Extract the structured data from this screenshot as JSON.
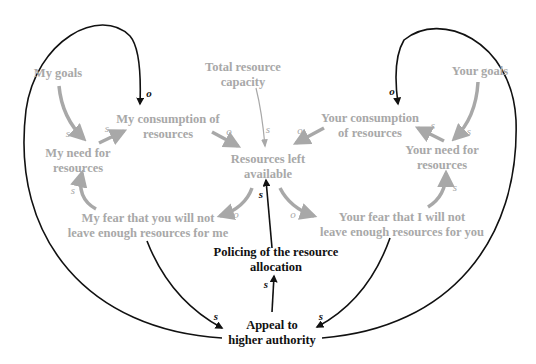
{
  "diagram": {
    "type": "causal-loop",
    "colors": {
      "gray_node": "#a8a8a8",
      "gray_arrow": "#a8a8a8",
      "dark_node": "#111111",
      "dark_arrow": "#111111",
      "background": "#ffffff"
    },
    "nodes": {
      "my_goals": {
        "lines": [
          "My goals"
        ]
      },
      "my_need": {
        "lines": [
          "My need for",
          "resources"
        ]
      },
      "my_consumption": {
        "lines": [
          "My consumption of",
          "resources"
        ]
      },
      "total_capacity": {
        "lines": [
          "Total resource",
          "capacity"
        ]
      },
      "resources_left": {
        "lines": [
          "Resources left",
          "available"
        ]
      },
      "your_consumption": {
        "lines": [
          "Your consumption",
          "of resources"
        ]
      },
      "your_goals": {
        "lines": [
          "Your goals"
        ]
      },
      "your_need": {
        "lines": [
          "Your need for",
          "resources"
        ]
      },
      "my_fear": {
        "lines": [
          "My fear that you will not",
          "leave enough resources for me"
        ]
      },
      "your_fear": {
        "lines": [
          "Your fear that I will not",
          "leave enough resources for you"
        ]
      },
      "policing": {
        "lines": [
          "Policing of the resource",
          "allocation"
        ]
      },
      "appeal": {
        "lines": [
          "Appeal to",
          "higher authority"
        ]
      }
    },
    "links": [
      {
        "from": "My goals",
        "to": "My need for resources",
        "polarity": "s"
      },
      {
        "from": "My need for resources",
        "to": "My consumption of resources",
        "polarity": "s"
      },
      {
        "from": "My consumption of resources",
        "to": "Resources left available",
        "polarity": "o"
      },
      {
        "from": "Total resource capacity",
        "to": "Resources left available",
        "polarity": "s"
      },
      {
        "from": "Your consumption of resources",
        "to": "Resources left available",
        "polarity": "o"
      },
      {
        "from": "Your goals",
        "to": "Your need for resources",
        "polarity": "s"
      },
      {
        "from": "Your need for resources",
        "to": "Your consumption of resources",
        "polarity": "s"
      },
      {
        "from": "Resources left available",
        "to": "My fear that you will not leave enough resources for me",
        "polarity": "o"
      },
      {
        "from": "Resources left available",
        "to": "Your fear that I will not leave enough resources for you",
        "polarity": "o"
      },
      {
        "from": "My fear that you will not leave enough resources for me",
        "to": "My need for resources",
        "polarity": "s"
      },
      {
        "from": "Your fear that I will not leave enough resources for you",
        "to": "Your need for resources",
        "polarity": "s"
      },
      {
        "from": "My fear that you will not leave enough resources for me",
        "to": "Appeal to higher authority",
        "polarity": "s"
      },
      {
        "from": "Your fear that I will not leave enough resources for you",
        "to": "Appeal to higher authority",
        "polarity": "s"
      },
      {
        "from": "Appeal to higher authority",
        "to": "Policing of the resource allocation",
        "polarity": "s"
      },
      {
        "from": "Policing of the resource allocation",
        "to": "Resources left available",
        "polarity": "s"
      },
      {
        "from": "Appeal to higher authority",
        "to": "My consumption of resources",
        "polarity": "o"
      },
      {
        "from": "Appeal to higher authority",
        "to": "Your consumption of resources",
        "polarity": "o"
      }
    ],
    "polarity_labels": {
      "goals_need_left": "s",
      "need_cons_left": "s",
      "cons_left_res": "o",
      "cap_res": "s",
      "cons_right_res": "o",
      "goals_need_right": "s",
      "need_cons_right": "s",
      "res_fear_left": "o",
      "res_fear_right": "o",
      "fear_need_left": "s",
      "fear_need_right": "s",
      "fear_appeal_left": "s",
      "fear_appeal_right": "s",
      "appeal_policing": "s",
      "policing_res": "s",
      "appeal_cons_left": "o",
      "appeal_cons_right": "o"
    }
  }
}
